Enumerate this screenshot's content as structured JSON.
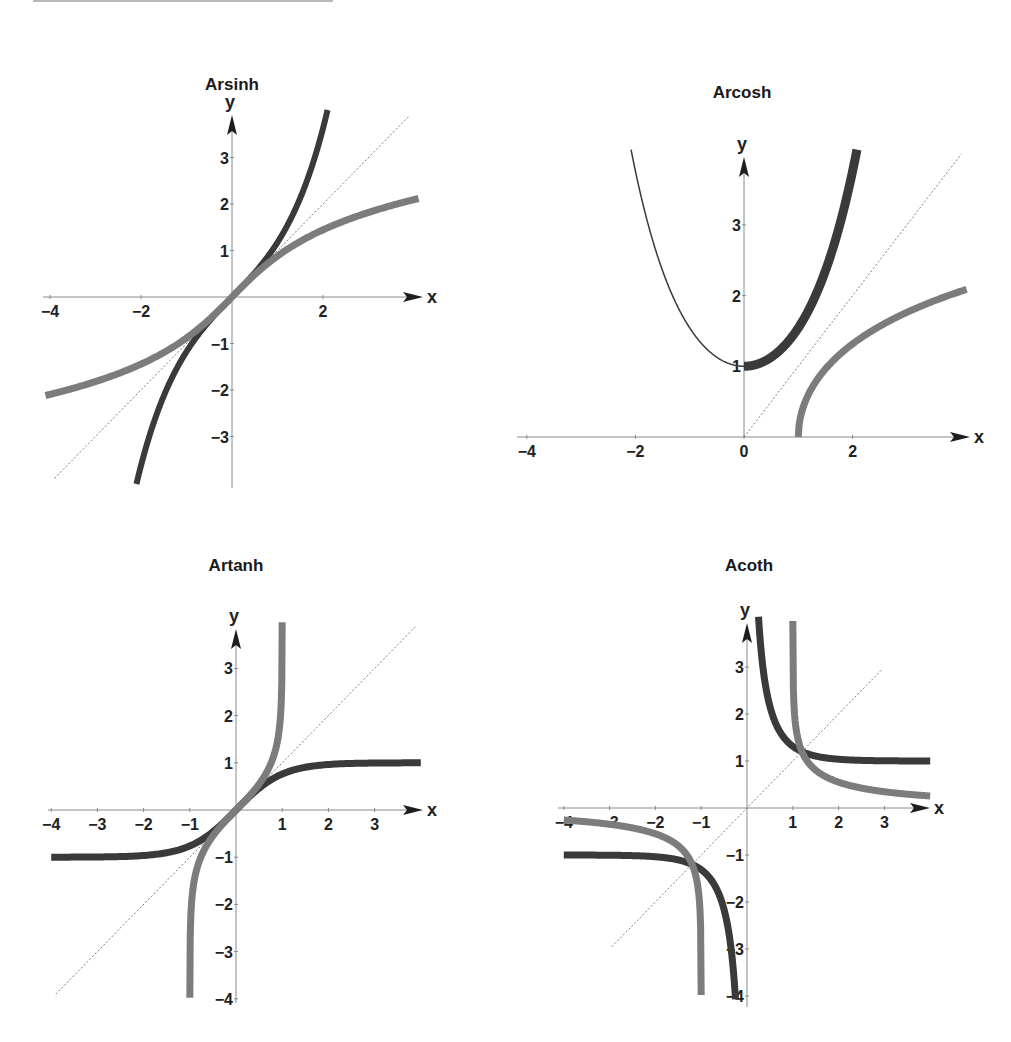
{
  "colors": {
    "background": "#ffffff",
    "axis": "#8a8a8a",
    "arrow": "#1e1e1e",
    "dark_curve": "#3a3a3a",
    "gray_curve": "#7c7c7c",
    "diagonal": "#777777",
    "text": "#222222"
  },
  "chart_data": [
    {
      "type": "line",
      "title": "Arsinh",
      "xlabel": "x",
      "ylabel": "y",
      "origin_px": [
        232,
        297
      ],
      "unit_px": [
        45.5,
        46.5
      ],
      "x_axis_px": [
        43,
        423
      ],
      "y_axis_px": [
        488,
        115
      ],
      "x_ticks": [
        {
          "v": -4,
          "label": "−4"
        },
        {
          "v": -2,
          "label": "−2"
        },
        {
          "v": 2,
          "label": "2"
        }
      ],
      "y_ticks": [
        {
          "v": 3,
          "label": "3"
        },
        {
          "v": 2,
          "label": "2"
        },
        {
          "v": 1,
          "label": "1"
        },
        {
          "v": -1,
          "label": "−1"
        },
        {
          "v": -2,
          "label": "−2"
        },
        {
          "v": -3,
          "label": "−3"
        }
      ],
      "title_pos": [
        232,
        90
      ],
      "series": [
        {
          "name": "sinh(x)",
          "fn": "sinh",
          "style": "dark",
          "width": 6,
          "x_range": [
            -2.1,
            2.1
          ],
          "y_clip": [
            -4.1,
            4.1
          ],
          "points": [
            [
              -2.06,
              -3.9
            ],
            [
              -1.5,
              -2.13
            ],
            [
              -1,
              -1.18
            ],
            [
              -0.5,
              -0.52
            ],
            [
              0,
              0
            ],
            [
              0.5,
              0.52
            ],
            [
              1,
              1.18
            ],
            [
              1.5,
              2.13
            ],
            [
              2.06,
              3.9
            ]
          ]
        },
        {
          "name": "arsinh(x)",
          "fn": "asinh",
          "style": "gray",
          "width": 7,
          "x_range": [
            -4.1,
            4.1
          ],
          "points": [
            [
              -4,
              -2.09
            ],
            [
              -3,
              -1.82
            ],
            [
              -2,
              -1.44
            ],
            [
              -1,
              -0.88
            ],
            [
              0,
              0
            ],
            [
              1,
              0.88
            ],
            [
              2,
              1.44
            ],
            [
              3,
              1.82
            ],
            [
              4,
              2.09
            ]
          ]
        },
        {
          "name": "y = x",
          "fn": "id",
          "style": "diagonal",
          "width": 1,
          "x_range": [
            -3.9,
            3.9
          ],
          "points": [
            [
              -3.9,
              -3.9
            ],
            [
              3.9,
              3.9
            ]
          ]
        }
      ]
    },
    {
      "type": "line",
      "title": "Arcosh",
      "xlabel": "x",
      "ylabel": "y",
      "origin_px": [
        744,
        437
      ],
      "unit_px": [
        54.3,
        70.7
      ],
      "x_axis_px": [
        517,
        970
      ],
      "y_axis_px": [
        437,
        157
      ],
      "x_ticks": [
        {
          "v": -4,
          "label": "−4"
        },
        {
          "v": -2,
          "label": "−2"
        },
        {
          "v": 0,
          "label": "0"
        },
        {
          "v": 2,
          "label": "2"
        }
      ],
      "y_ticks": [
        {
          "v": 3,
          "label": "3"
        },
        {
          "v": 2,
          "label": "2"
        },
        {
          "v": 1,
          "label": "1"
        }
      ],
      "title_pos": [
        742,
        98
      ],
      "series": [
        {
          "name": "cosh(x), x<0",
          "fn": "cosh",
          "style": "dark",
          "width": 1.5,
          "x_range": [
            -2.08,
            0
          ],
          "points": [
            [
              -2.06,
              3.98
            ],
            [
              -1.5,
              2.35
            ],
            [
              -1,
              1.54
            ],
            [
              -0.5,
              1.13
            ],
            [
              0,
              1
            ]
          ]
        },
        {
          "name": "cosh(x), x≥0",
          "fn": "cosh",
          "style": "dark",
          "width": 9,
          "x_range": [
            0,
            2.08
          ],
          "points": [
            [
              0,
              1
            ],
            [
              0.5,
              1.13
            ],
            [
              1,
              1.54
            ],
            [
              1.5,
              2.35
            ],
            [
              2.06,
              3.98
            ]
          ]
        },
        {
          "name": "arcosh(x)",
          "fn": "acosh",
          "style": "gray",
          "width": 7,
          "x_range": [
            1,
            4.1
          ],
          "points": [
            [
              1,
              0
            ],
            [
              1.5,
              0.96
            ],
            [
              2,
              1.32
            ],
            [
              3,
              1.76
            ],
            [
              4,
              2.06
            ]
          ]
        },
        {
          "name": "y = x",
          "fn": "id",
          "style": "diagonal",
          "width": 1,
          "x_range": [
            0,
            4
          ],
          "points": [
            [
              0,
              0
            ],
            [
              4,
              4
            ]
          ]
        }
      ]
    },
    {
      "type": "line",
      "title": "Artanh",
      "xlabel": "x",
      "ylabel": "y",
      "origin_px": [
        236,
        810
      ],
      "unit_px": [
        46.2,
        47.2
      ],
      "x_axis_px": [
        48,
        423
      ],
      "y_axis_px": [
        1003,
        629
      ],
      "x_ticks": [
        {
          "v": -4,
          "label": "−4"
        },
        {
          "v": -3,
          "label": "−3"
        },
        {
          "v": -2,
          "label": "−2"
        },
        {
          "v": -1,
          "label": "−1"
        },
        {
          "v": 1,
          "label": "1"
        },
        {
          "v": 2,
          "label": "2"
        },
        {
          "v": 3,
          "label": "3"
        }
      ],
      "y_ticks": [
        {
          "v": 3,
          "label": "3"
        },
        {
          "v": 2,
          "label": "2"
        },
        {
          "v": 1,
          "label": "1"
        },
        {
          "v": -1,
          "label": "−1"
        },
        {
          "v": -2,
          "label": "−2"
        },
        {
          "v": -3,
          "label": "−3"
        },
        {
          "v": -4,
          "label": "−4"
        }
      ],
      "title_pos": [
        236,
        571
      ],
      "series": [
        {
          "name": "tanh(x)",
          "fn": "tanh",
          "style": "dark",
          "width": 7,
          "x_range": [
            -4,
            4
          ],
          "points": [
            [
              -4,
              -1
            ],
            [
              -2,
              -0.96
            ],
            [
              -1,
              -0.76
            ],
            [
              0,
              0
            ],
            [
              1,
              0.76
            ],
            [
              2,
              0.96
            ],
            [
              4,
              1
            ]
          ]
        },
        {
          "name": "artanh(x)",
          "fn": "atanh",
          "style": "gray",
          "width": 7,
          "x_range": [
            -0.9993,
            0.9993
          ],
          "y_clip": [
            -4.0,
            4.0
          ],
          "points": [
            [
              -0.9993,
              -4
            ],
            [
              -0.9,
              -1.47
            ],
            [
              -0.5,
              -0.55
            ],
            [
              0,
              0
            ],
            [
              0.5,
              0.55
            ],
            [
              0.9,
              1.47
            ],
            [
              0.9993,
              4
            ]
          ]
        },
        {
          "name": "y = x",
          "fn": "id",
          "style": "diagonal",
          "width": 1,
          "x_range": [
            -3.9,
            3.9
          ],
          "points": [
            [
              -3.9,
              -3.9
            ],
            [
              3.9,
              3.9
            ]
          ]
        }
      ]
    },
    {
      "type": "line",
      "title": "Acoth",
      "xlabel": "x",
      "ylabel": "y",
      "origin_px": [
        747,
        808
      ],
      "unit_px": [
        45.8,
        47.0
      ],
      "x_axis_px": [
        558,
        930
      ],
      "y_axis_px": [
        1007,
        623
      ],
      "x_ticks": [
        {
          "v": -4,
          "label": "−4"
        },
        {
          "v": -3,
          "label": "−3"
        },
        {
          "v": -2,
          "label": "−2"
        },
        {
          "v": -1,
          "label": "−1"
        },
        {
          "v": 1,
          "label": "1"
        },
        {
          "v": 2,
          "label": "2"
        },
        {
          "v": 3,
          "label": "3"
        }
      ],
      "y_ticks": [
        {
          "v": 3,
          "label": "3"
        },
        {
          "v": 2,
          "label": "2"
        },
        {
          "v": 1,
          "label": "1"
        },
        {
          "v": -1,
          "label": "−1"
        },
        {
          "v": -2,
          "label": "−2"
        },
        {
          "v": -3,
          "label": "−3"
        },
        {
          "v": -4,
          "label": "−4"
        }
      ],
      "title_pos": [
        749,
        571
      ],
      "series": [
        {
          "name": "coth(x), x>0",
          "fn": "coth",
          "style": "dark",
          "width": 7,
          "x_range": [
            0.251,
            4
          ],
          "y_clip": [
            -4.1,
            4.1
          ],
          "points": [
            [
              0.25,
              4.08
            ],
            [
              0.5,
              2.16
            ],
            [
              1,
              1.31
            ],
            [
              2,
              1.04
            ],
            [
              4,
              1
            ]
          ]
        },
        {
          "name": "coth(x), x<0",
          "fn": "coth",
          "style": "dark",
          "width": 7,
          "x_range": [
            -4,
            -0.251
          ],
          "y_clip": [
            -4.1,
            4.1
          ],
          "points": [
            [
              -4,
              -1
            ],
            [
              -2,
              -1.04
            ],
            [
              -1,
              -1.31
            ],
            [
              -0.5,
              -2.16
            ],
            [
              -0.25,
              -4.08
            ]
          ]
        },
        {
          "name": "arcoth(x), x>1",
          "fn": "acoth",
          "style": "gray",
          "width": 7,
          "x_range": [
            1.0007,
            4
          ],
          "points": [
            [
              1.0007,
              4
            ],
            [
              1.2,
              1.2
            ],
            [
              2,
              0.55
            ],
            [
              3,
              0.35
            ],
            [
              4,
              0.26
            ]
          ]
        },
        {
          "name": "arcoth(x), x<-1",
          "fn": "acoth",
          "style": "gray",
          "width": 7,
          "x_range": [
            -4,
            -1.0007
          ],
          "points": [
            [
              -4,
              -0.26
            ],
            [
              -3,
              -0.35
            ],
            [
              -2,
              -0.55
            ],
            [
              -1.2,
              -1.2
            ],
            [
              -1.0007,
              -4
            ]
          ]
        },
        {
          "name": "y = x",
          "fn": "id",
          "style": "diagonal",
          "width": 1,
          "x_range": [
            -2.95,
            2.95
          ],
          "points": [
            [
              -2.95,
              -2.95
            ],
            [
              2.95,
              2.95
            ]
          ]
        }
      ]
    }
  ]
}
